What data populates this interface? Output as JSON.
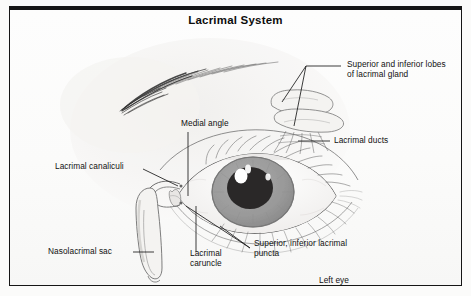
{
  "figure": {
    "title": "Lacrimal System",
    "view_note": "Left eye",
    "background_color": "#fbfbfa",
    "border_color": "#161616"
  },
  "labels": [
    {
      "id": "lacrimal-gland-lobes",
      "text": "Superior and inferior lobes\nof lacrimal gland",
      "x": 337,
      "y": 53
    },
    {
      "id": "lacrimal-ducts",
      "text": "Lacrimal ducts",
      "x": 324,
      "y": 128
    },
    {
      "id": "medial-angle",
      "text": "Medial angle",
      "x": 171,
      "y": 112
    },
    {
      "id": "lacrimal-canaliculi",
      "text": "Lacrimal canaliculi",
      "x": 45,
      "y": 155
    },
    {
      "id": "nasolacrimal-sac",
      "text": "Nasolacrimal sac",
      "x": 38,
      "y": 238
    },
    {
      "id": "lacrimal-caruncle",
      "text": "Lacrimal\ncaruncle",
      "x": 180,
      "y": 246
    },
    {
      "id": "lacrimal-puncta",
      "text": "Superior, inferior lacrimal\npuncta",
      "x": 244,
      "y": 235
    },
    {
      "id": "left-eye",
      "text": "Left eye",
      "x": 309,
      "y": 269
    }
  ],
  "anatomy": {
    "iris_color": "#9c9c9c",
    "pupil_color": "#2a2828",
    "highlight_color": "#ffffff",
    "sketch_color": "#8f8f8f",
    "skin_tone": "#f2f1ef",
    "parts": [
      "eyebrow",
      "upper-eyelid",
      "lower-eyelid",
      "eyelashes",
      "sclera",
      "iris",
      "pupil",
      "corneal-highlight",
      "lacrimal-gland",
      "lacrimal-ducts",
      "lacrimal-canaliculi",
      "lacrimal-sac",
      "nasolacrimal-duct",
      "lacrimal-caruncle",
      "puncta"
    ]
  }
}
